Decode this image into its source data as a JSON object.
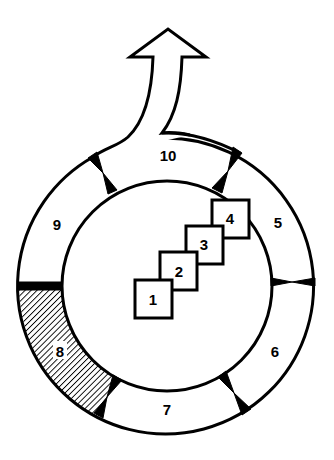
{
  "diagram": {
    "type": "cycle-with-steps",
    "colors": {
      "stroke": "#000000",
      "background": "#ffffff",
      "hatch": "#000000"
    },
    "center_steps": [
      {
        "label": "1"
      },
      {
        "label": "2"
      },
      {
        "label": "3"
      },
      {
        "label": "4"
      }
    ],
    "ring_segments": [
      {
        "label": "5",
        "fill": "plain"
      },
      {
        "label": "6",
        "fill": "plain"
      },
      {
        "label": "7",
        "fill": "plain"
      },
      {
        "label": "8",
        "fill": "hatched"
      },
      {
        "label": "9",
        "fill": "plain"
      },
      {
        "label": "10",
        "fill": "plain",
        "has_exit_arrow": true
      }
    ],
    "exit_arrow": {
      "direction": "up",
      "from_segment": "10"
    }
  }
}
